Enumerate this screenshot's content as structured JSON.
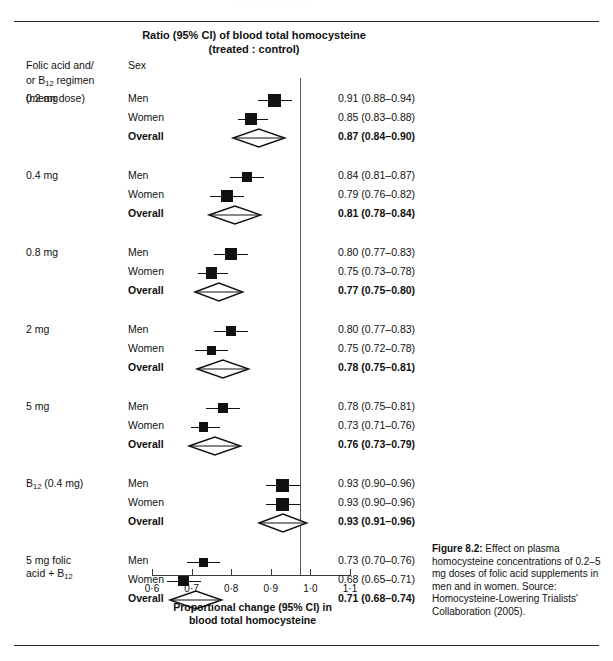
{
  "page": {
    "running_head_ghost": "·  ···  ···        ·····         ···"
  },
  "header": {
    "title_line1": "Ratio (95% CI) of blood total homocysteine",
    "title_line2": "(treated : control)",
    "col_regimen_line1": "Folic acid and/",
    "col_regimen_line2_a": "or B",
    "col_regimen_line2_sub": "12",
    "col_regimen_line2_b": " regimen",
    "col_regimen_line3": "(mean dose)",
    "col_sex": "Sex"
  },
  "axis": {
    "title_line1": "Proportional change (95% CI) in",
    "title_line2": "blood total homocysteine",
    "ticks": [
      "0·6",
      "0·7",
      "0·8",
      "0·9",
      "1·0",
      "1·1"
    ],
    "tick_values": [
      0.6,
      0.7,
      0.8,
      0.9,
      1.0,
      1.1
    ],
    "reference_value": 1.0
  },
  "caption": {
    "figure_label": "Figure 8.2:",
    "text": "Effect on plasma homocysteine concentrations of 0.2–5 mg doses of folic acid supplements in men and in women.",
    "source": "Source: Homocysteine-Lowering Trialists' Collaboration (2005)."
  },
  "chart_data": {
    "type": "forest",
    "title": "Ratio (95% CI) of blood total homocysteine (treated : control)",
    "xlabel": "Proportional change (95% CI) in blood total homocysteine",
    "ylabel": "",
    "xlim": [
      0.6,
      1.1
    ],
    "xticks": [
      0.6,
      0.7,
      0.8,
      0.9,
      1.0,
      1.1
    ],
    "reference_line": 1.0,
    "grid": false,
    "legend": "none",
    "effect_measure": "Ratio of blood total homocysteine (treated : control)",
    "groups": [
      {
        "label": "0.2 mg",
        "label_lines": [
          "0.2 mg"
        ],
        "rows": [
          {
            "sex": "Men",
            "estimate": 0.91,
            "lower": 0.88,
            "upper": 0.94,
            "text": "0.91 (0.88–0.94)",
            "marker": "square",
            "size": 1.0,
            "bold": false
          },
          {
            "sex": "Women",
            "estimate": 0.85,
            "lower": 0.83,
            "upper": 0.88,
            "text": "0.85 (0.83–0.88)",
            "marker": "square",
            "size": 0.92,
            "bold": false
          },
          {
            "sex": "Overall",
            "estimate": 0.87,
            "lower": 0.84,
            "upper": 0.9,
            "text": "0.87 (0.84–0.90)",
            "marker": "diamond",
            "size": 1.0,
            "bold": true
          }
        ]
      },
      {
        "label": "0.4 mg",
        "label_lines": [
          "0.4 mg"
        ],
        "rows": [
          {
            "sex": "Men",
            "estimate": 0.84,
            "lower": 0.81,
            "upper": 0.87,
            "text": "0.84 (0.81–0.87)",
            "marker": "square",
            "size": 0.86,
            "bold": false
          },
          {
            "sex": "Women",
            "estimate": 0.79,
            "lower": 0.76,
            "upper": 0.82,
            "text": "0.79 (0.76–0.82)",
            "marker": "square",
            "size": 0.92,
            "bold": false
          },
          {
            "sex": "Overall",
            "estimate": 0.81,
            "lower": 0.78,
            "upper": 0.84,
            "text": "0.81 (0.78–0.84)",
            "marker": "diamond",
            "size": 1.0,
            "bold": true
          }
        ]
      },
      {
        "label": "0.8 mg",
        "label_lines": [
          "0.8 mg"
        ],
        "rows": [
          {
            "sex": "Men",
            "estimate": 0.8,
            "lower": 0.77,
            "upper": 0.83,
            "text": "0.80 (0.77–0.83)",
            "marker": "square",
            "size": 0.92,
            "bold": false
          },
          {
            "sex": "Women",
            "estimate": 0.75,
            "lower": 0.73,
            "upper": 0.78,
            "text": "0.75 (0.73–0.78)",
            "marker": "square",
            "size": 0.92,
            "bold": false
          },
          {
            "sex": "Overall",
            "estimate": 0.77,
            "lower": 0.75,
            "upper": 0.8,
            "text": "0.77 (0.75–0.80)",
            "marker": "diamond",
            "size": 1.0,
            "bold": true
          }
        ]
      },
      {
        "label": "2 mg",
        "label_lines": [
          "2 mg"
        ],
        "rows": [
          {
            "sex": "Men",
            "estimate": 0.8,
            "lower": 0.77,
            "upper": 0.83,
            "text": "0.80 (0.77–0.83)",
            "marker": "square",
            "size": 0.8,
            "bold": false
          },
          {
            "sex": "Women",
            "estimate": 0.75,
            "lower": 0.72,
            "upper": 0.78,
            "text": "0.75 (0.72–0.78)",
            "marker": "square",
            "size": 0.74,
            "bold": false
          },
          {
            "sex": "Overall",
            "estimate": 0.78,
            "lower": 0.75,
            "upper": 0.81,
            "text": "0.78 (0.75–0.81)",
            "marker": "diamond",
            "size": 1.0,
            "bold": true
          }
        ]
      },
      {
        "label": "5 mg",
        "label_lines": [
          "5 mg"
        ],
        "rows": [
          {
            "sex": "Men",
            "estimate": 0.78,
            "lower": 0.75,
            "upper": 0.81,
            "text": "0.78 (0.75–0.81)",
            "marker": "square",
            "size": 0.8,
            "bold": false
          },
          {
            "sex": "Women",
            "estimate": 0.73,
            "lower": 0.71,
            "upper": 0.76,
            "text": "0.73 (0.71–0.76)",
            "marker": "square",
            "size": 0.8,
            "bold": false
          },
          {
            "sex": "Overall",
            "estimate": 0.76,
            "lower": 0.73,
            "upper": 0.79,
            "text": "0.76 (0.73–0.79)",
            "marker": "diamond",
            "size": 1.0,
            "bold": true
          }
        ]
      },
      {
        "label": "B12 (0.4 mg)",
        "label_lines": [
          "B",
          "12",
          " (0.4 mg)"
        ],
        "has_subscript": true,
        "rows": [
          {
            "sex": "Men",
            "estimate": 0.93,
            "lower": 0.9,
            "upper": 0.96,
            "text": "0.93 (0.90–0.96)",
            "marker": "square",
            "size": 1.0,
            "bold": false
          },
          {
            "sex": "Women",
            "estimate": 0.93,
            "lower": 0.9,
            "upper": 0.96,
            "text": "0.93 (0.90–0.96)",
            "marker": "square",
            "size": 1.0,
            "bold": false
          },
          {
            "sex": "Overall",
            "estimate": 0.93,
            "lower": 0.91,
            "upper": 0.96,
            "text": "0.93 (0.91–0.96)",
            "marker": "diamond",
            "size": 1.0,
            "bold": true
          }
        ]
      },
      {
        "label": "5 mg folic acid + B12",
        "label_lines": [
          "5 mg folic",
          "acid + B",
          "12"
        ],
        "has_subscript": true,
        "rows": [
          {
            "sex": "Men",
            "estimate": 0.73,
            "lower": 0.7,
            "upper": 0.76,
            "text": "0.73 (0.70–0.76)",
            "marker": "square",
            "size": 0.74,
            "bold": false
          },
          {
            "sex": "Women",
            "estimate": 0.68,
            "lower": 0.65,
            "upper": 0.71,
            "text": "0.68 (0.65–0.71)",
            "marker": "square",
            "size": 0.86,
            "bold": false
          },
          {
            "sex": "Overall",
            "estimate": 0.71,
            "lower": 0.68,
            "upper": 0.74,
            "text": "0.71 (0.68–0.74)",
            "marker": "diamond",
            "size": 1.0,
            "bold": true
          }
        ]
      }
    ]
  }
}
